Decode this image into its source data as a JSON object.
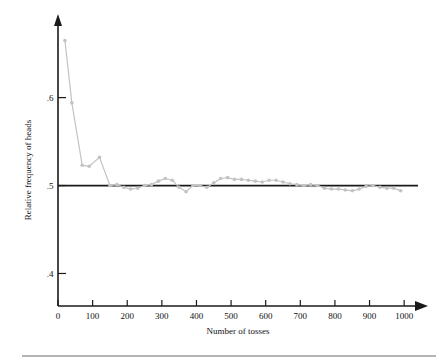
{
  "chart_data": {
    "type": "line",
    "title": "",
    "subtitle": "",
    "xlabel": "Number of tosses",
    "ylabel": "Relative frequency of heads",
    "xlim": [
      0,
      1040
    ],
    "ylim": [
      0.363,
      0.686
    ],
    "grid": false,
    "legend": null,
    "xticks": [
      0,
      100,
      200,
      300,
      400,
      500,
      600,
      700,
      800,
      900,
      1000
    ],
    "xticklabels": [
      "0",
      "100",
      "200",
      "300",
      "400",
      "500",
      "600",
      "700",
      "800",
      "900",
      "1000"
    ],
    "yticks": [
      0.4,
      0.5,
      0.6
    ],
    "yticklabels": [
      ".4",
      ".5",
      ".6"
    ],
    "reference_line": {
      "name": "probability-half-line",
      "y": 0.5,
      "x_start": 0,
      "x_end": 1040,
      "color": "#1a1a1a"
    },
    "series": [
      {
        "name": "Relative frequency of heads",
        "color": "#c3c3c3",
        "marker": "circle",
        "x": [
          20,
          40,
          70,
          90,
          120,
          150,
          170,
          190,
          210,
          230,
          250,
          270,
          290,
          310,
          330,
          350,
          370,
          390,
          410,
          430,
          450,
          470,
          490,
          510,
          530,
          550,
          570,
          590,
          610,
          630,
          650,
          670,
          690,
          710,
          730,
          750,
          770,
          790,
          810,
          830,
          850,
          870,
          890,
          910,
          930,
          950,
          970,
          990
        ],
        "y": [
          0.665,
          0.594,
          0.523,
          0.522,
          0.532,
          0.5,
          0.501,
          0.498,
          0.496,
          0.497,
          0.5,
          0.501,
          0.505,
          0.508,
          0.506,
          0.498,
          0.493,
          0.5,
          0.5,
          0.498,
          0.503,
          0.508,
          0.509,
          0.507,
          0.507,
          0.506,
          0.505,
          0.504,
          0.506,
          0.506,
          0.504,
          0.502,
          0.501,
          0.5,
          0.501,
          0.5,
          0.497,
          0.496,
          0.496,
          0.495,
          0.494,
          0.496,
          0.499,
          0.5,
          0.498,
          0.497,
          0.497,
          0.494
        ]
      }
    ]
  },
  "axes": {
    "x_axis_name": "x-axis",
    "y_axis_name": "y-axis",
    "arrow_heads": true
  },
  "footer": {
    "divider": true
  }
}
